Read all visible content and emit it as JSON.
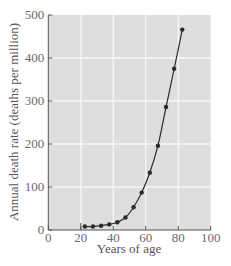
{
  "chart_data": {
    "type": "line",
    "title": "",
    "xlabel": "Years of age",
    "ylabel": "Annual death rate (deaths per million)",
    "xlim": [
      0,
      100
    ],
    "ylim": [
      0,
      500
    ],
    "x_ticks": [
      0,
      20,
      40,
      60,
      80,
      100
    ],
    "y_ticks": [
      0,
      100,
      200,
      300,
      400,
      500
    ],
    "grid": true,
    "legend": null,
    "series": [
      {
        "name": "Death rate",
        "x": [
          22.5,
          27.5,
          32.5,
          37.5,
          42.5,
          47.5,
          52.5,
          57.5,
          62.5,
          67.5,
          72.5,
          77.5,
          82.5
        ],
        "values": [
          8,
          8,
          10,
          13,
          18,
          29,
          53,
          87,
          133,
          196,
          286,
          375,
          466
        ]
      }
    ]
  },
  "colors": {
    "plot_background": "#dedede",
    "grid": "#f7f7f7",
    "line": "#2a2a2a",
    "text": "#6a6a6a"
  }
}
